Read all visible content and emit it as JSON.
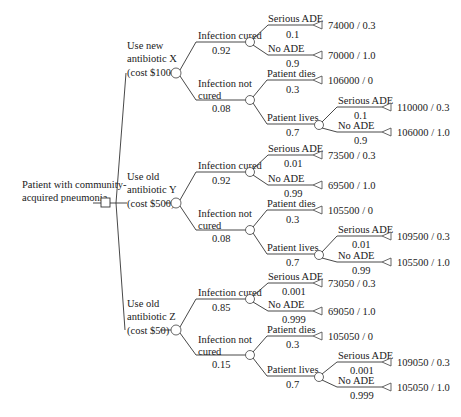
{
  "root": {
    "label_lines": [
      "Patient with community-",
      "acquired pneumonia"
    ],
    "node_type": "decision"
  },
  "strategies": [
    {
      "label_lines": [
        "Use new",
        "antibiotic X",
        "(cost $1000)"
      ],
      "cured": {
        "label": "Infection cured",
        "prob": "0.92",
        "serious_ade": {
          "label": "Serious ADE",
          "prob": "0.1",
          "payoff": "74000 / 0.3"
        },
        "no_ade": {
          "label": "No ADE",
          "prob": "0.9",
          "payoff": "70000 / 1.0"
        }
      },
      "not_cured": {
        "label_lines": [
          "Infection not",
          "cured"
        ],
        "prob": "0.08",
        "dies": {
          "label": "Patient dies",
          "prob": "0.3",
          "payoff": "106000 / 0"
        },
        "lives": {
          "label": "Patient lives",
          "prob": "0.7",
          "serious_ade": {
            "label": "Serious ADE",
            "prob": "0.1",
            "payoff": "110000 / 0.3"
          },
          "no_ade": {
            "label": "No ADE",
            "prob": "0.9",
            "payoff": "106000 / 1.0"
          }
        }
      }
    },
    {
      "label_lines": [
        "Use old",
        "antibiotic Y",
        "(cost $500)"
      ],
      "cured": {
        "label": "Infection cured",
        "prob": "0.92",
        "serious_ade": {
          "label": "Serious ADE",
          "prob": "0.01",
          "payoff": "73500 / 0.3"
        },
        "no_ade": {
          "label": "No ADE",
          "prob": "0.99",
          "payoff": "69500 / 1.0"
        }
      },
      "not_cured": {
        "label_lines": [
          "Infection not",
          "cured"
        ],
        "prob": "0.08",
        "dies": {
          "label": "Patient dies",
          "prob": "0.3",
          "payoff": "105500 / 0"
        },
        "lives": {
          "label": "Patient lives",
          "prob": "0.7",
          "serious_ade": {
            "label": "Serious ADE",
            "prob": "0.01",
            "payoff": "109500 / 0.3"
          },
          "no_ade": {
            "label": "No ADE",
            "prob": "0.99",
            "payoff": "105500 / 1.0"
          }
        }
      }
    },
    {
      "label_lines": [
        "Use old",
        "antibiotic Z",
        "(cost $50)"
      ],
      "cured": {
        "label": "Infection cured",
        "prob": "0.85",
        "serious_ade": {
          "label": "Serious ADE",
          "prob": "0.001",
          "payoff": "73050 / 0.3"
        },
        "no_ade": {
          "label": "No ADE",
          "prob": "0.999",
          "payoff": "69050 / 1.0"
        }
      },
      "not_cured": {
        "label_lines": [
          "Infection not",
          "cured"
        ],
        "prob": "0.15",
        "dies": {
          "label": "Patient dies",
          "prob": "0.3",
          "payoff": "105050 / 0"
        },
        "lives": {
          "label": "Patient lives",
          "prob": "0.7",
          "serious_ade": {
            "label": "Serious ADE",
            "prob": "0.001",
            "payoff": "109050 / 0.3"
          },
          "no_ade": {
            "label": "No ADE",
            "prob": "0.999",
            "payoff": "105050 / 1.0"
          }
        }
      }
    }
  ],
  "colors": {
    "line": "#333333",
    "text": "#1a1a1a",
    "background": "#ffffff"
  }
}
